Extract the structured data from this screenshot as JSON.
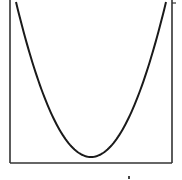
{
  "chart_data": {
    "type": "line",
    "title": "",
    "xlabel": "",
    "ylabel": "",
    "grid": false,
    "legend": null,
    "series": [
      {
        "name": "parabola",
        "color": "#1a1a1a",
        "x": [
          -1.0,
          -0.8,
          -0.6,
          -0.4,
          -0.2,
          0.0,
          0.2,
          0.4,
          0.6,
          0.8,
          1.0
        ],
        "y": [
          1.0,
          0.64,
          0.36,
          0.16,
          0.04,
          0.0,
          0.04,
          0.16,
          0.36,
          0.64,
          1.0
        ]
      }
    ],
    "xlim": [
      -1.0,
      1.0
    ],
    "ylim": [
      -0.04,
      1.0
    ],
    "tick_labels": {
      "x": [],
      "y": []
    }
  },
  "colors": {
    "line": "#1a1a1a",
    "frame": "#333333",
    "background": "#ffffff"
  },
  "labels": {
    "bottom_mark": "'"
  }
}
